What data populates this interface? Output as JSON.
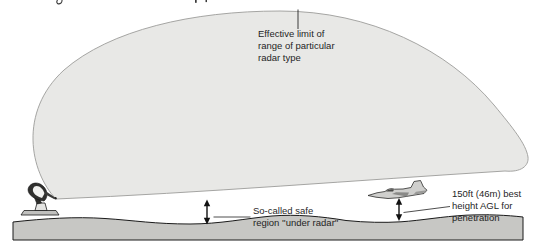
{
  "diagram": {
    "type": "radar-coverage-envelope-diagram",
    "annotations": {
      "effective_limit": {
        "line1": "Effective limit of",
        "line2": "range of particular",
        "line3": "radar type"
      },
      "safe_region": {
        "line1": "So-called safe",
        "line2": "region ''under radar''"
      },
      "penetration_height": {
        "line1": "150ft (46m) best",
        "line2": "height AGL for",
        "line3": "penetration"
      }
    },
    "icons": [
      {
        "name": "radar-dish-icon",
        "meaning": "ground radar installation at left edge of coverage dome"
      },
      {
        "name": "jet-aircraft-icon",
        "meaning": "low-flying aircraft penetrating under the radar"
      }
    ],
    "colors": {
      "background": "#ffffff",
      "dome_fill": "#e8e8e6",
      "dome_stroke": "#9c9c9a",
      "ground_fill": "#c7c7c4",
      "ground_stroke": "#1a1a1a",
      "annotation_text": "#1f1f1f",
      "arrow": "#111111"
    }
  }
}
